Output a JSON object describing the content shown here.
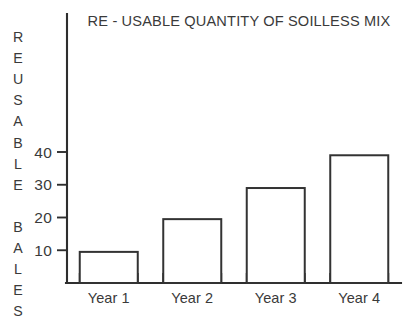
{
  "chart_data": {
    "type": "bar",
    "title": "RE - USABLE QUANTITY OF SOILLESS MIX",
    "xlabel": "",
    "ylabel": "REUSABLE BALES",
    "ylabel_lines": [
      "REUSABLE",
      "BALES"
    ],
    "categories": [
      "Year 1",
      "Year 2",
      "Year 3",
      "Year 4"
    ],
    "values": [
      9.5,
      19.5,
      29,
      39
    ],
    "ytick_labels": [
      "10",
      "20",
      "30",
      "40"
    ],
    "ytick_values": [
      10,
      20,
      30,
      40
    ],
    "ylim": [
      0,
      46
    ],
    "grid": false,
    "legend": null,
    "bar_fill_color": "#ffffff",
    "bar_stroke_color": "#333333",
    "axis_color": "#2e2e2e",
    "text_color": "#3a3a3a",
    "background_color": "#ffffff"
  },
  "axis": {
    "y_axis_name": "y-axis",
    "x_axis_name": "x-axis"
  }
}
